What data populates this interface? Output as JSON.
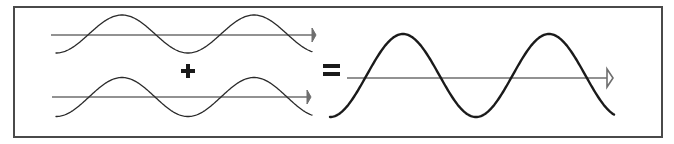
{
  "diagram": {
    "colors": {
      "background": "#ffffff",
      "frame": "#4a4a4a",
      "axis": "#6e6e6e",
      "input_wave": "#2a2a2a",
      "result_wave": "#1a1a1a",
      "operator": "#1a1a1a"
    },
    "frame": {
      "x": 14,
      "y": 7,
      "width": 648,
      "height": 130
    },
    "waves": [
      {
        "id": "wave-1",
        "role": "input",
        "axis": {
          "x1": 51,
          "x2": 316,
          "y": 35,
          "arrowhead": "filled"
        },
        "start_x": 56,
        "end_x": 312,
        "baseline_y": 34,
        "amplitude": 19,
        "half_period": 66,
        "start_phase": "trough",
        "stroke_width": 1.3
      },
      {
        "id": "wave-2",
        "role": "input",
        "axis": {
          "x1": 52,
          "x2": 311,
          "y": 97,
          "arrowhead": "filled"
        },
        "start_x": 56,
        "end_x": 312,
        "baseline_y": 97,
        "amplitude": 19.5,
        "half_period": 66,
        "start_phase": "trough",
        "stroke_width": 1.3
      },
      {
        "id": "wave-result",
        "role": "sum",
        "axis": {
          "x1": 347,
          "x2": 613,
          "y": 78,
          "arrowhead": "hollow"
        },
        "start_x": 330,
        "end_x": 614,
        "baseline_y": 75.5,
        "amplitude": 41.5,
        "half_period": 73,
        "start_phase": "trough",
        "stroke_width": 2.4
      }
    ],
    "operators": [
      {
        "symbol": "plus",
        "label": "+",
        "cx": 188,
        "cy": 71
      },
      {
        "symbol": "equals",
        "label": "=",
        "cx": 331,
        "cy": 70
      }
    ]
  }
}
